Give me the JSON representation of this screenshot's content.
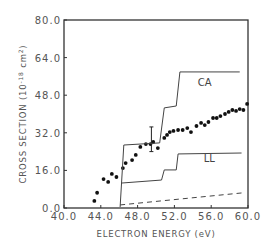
{
  "chart_data": {
    "type": "scatter",
    "title": "",
    "xlabel": "ELECTRON ENERGY (eV)",
    "ylabel": "CROSS SECTION (10^-18 cm^2)",
    "ylabel_parts": {
      "main": "CROSS SECTION (10",
      "exp": "-18",
      "unit": " cm",
      "unit_exp": "2",
      "close": ")"
    },
    "xlim": [
      40,
      60
    ],
    "ylim": [
      0,
      80
    ],
    "x_ticks": [
      "40.0",
      "44.0",
      "48.0",
      "52.0",
      "56.0",
      "60.0"
    ],
    "y_ticks": [
      "0.0",
      "16.0",
      "32.0",
      "48.0",
      "64.0",
      "80.0"
    ],
    "grid": false,
    "series": [
      {
        "name": "measured",
        "kind": "points",
        "x": [
          43.3,
          43.6,
          44.3,
          44.8,
          45.2,
          45.7,
          46.4,
          46.7,
          47.4,
          47.8,
          48.3,
          48.9,
          49.4,
          49.7,
          50.2,
          50.9,
          51.2,
          51.5,
          51.9,
          52.4,
          52.9,
          53.4,
          53.8,
          54.4,
          54.9,
          55.3,
          55.7,
          56.2,
          56.6,
          57.0,
          57.5,
          57.9,
          58.3,
          58.7,
          59.1,
          59.5,
          59.9
        ],
        "y": [
          3.0,
          6.5,
          12.3,
          11.1,
          14.5,
          13.2,
          17.0,
          19.1,
          20.4,
          22.6,
          26.0,
          27.2,
          27.2,
          28.1,
          25.5,
          29.8,
          31.1,
          32.3,
          32.8,
          33.2,
          33.2,
          34.0,
          32.3,
          34.9,
          36.2,
          35.3,
          36.6,
          38.3,
          38.3,
          39.1,
          40.0,
          40.9,
          41.7,
          41.3,
          42.1,
          41.7,
          44.3
        ],
        "error_bar": {
          "x": 49.5,
          "y": 28.5,
          "low": 24.0,
          "high": 34.5
        }
      },
      {
        "name": "CA",
        "kind": "step",
        "x": [
          46.1,
          46.5,
          50.4,
          50.9,
          52.2,
          52.6,
          59.1
        ],
        "y": [
          0.4,
          26.8,
          27.7,
          42.6,
          43.4,
          57.9,
          57.9
        ]
      },
      {
        "name": "LL",
        "kind": "step",
        "x": [
          46.2,
          50.6,
          50.9,
          52.2,
          52.4,
          59.3
        ],
        "y": [
          10.6,
          11.9,
          16.2,
          16.2,
          23.0,
          23.4
        ]
      },
      {
        "name": "dashed",
        "kind": "dashed",
        "x": [
          46.1,
          59.3
        ],
        "y": [
          1.3,
          6.4
        ]
      }
    ],
    "annotations": [
      {
        "text": "CA",
        "x": 55.3,
        "y": 52.0
      },
      {
        "text": "LL",
        "x": 55.8,
        "y": 19.5
      }
    ]
  }
}
